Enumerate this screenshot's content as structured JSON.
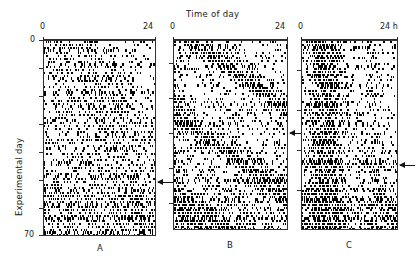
{
  "figure": {
    "title": "Time of day",
    "ylabel": "Experimental day",
    "y_ticks": [
      "0",
      "70"
    ],
    "ink_color": "#000000",
    "axis_color": "#2b2b2b"
  },
  "panels": [
    {
      "letter": "A",
      "x_left_label": "0",
      "x_right_label": "24",
      "arrow_day": 49,
      "pattern": "arrhythmic-scattered"
    },
    {
      "letter": "B",
      "x_left_label": "0",
      "x_right_label": "24",
      "arrow_day": 33,
      "pattern": "free-running-diagonal"
    },
    {
      "letter": "C",
      "x_left_label": "0",
      "x_right_label": "24 h",
      "arrow_day": 44,
      "pattern": "dense-left-entrained"
    }
  ],
  "chart_data": {
    "type": "heatmap",
    "title": "Time of day",
    "xlabel": "Time of day",
    "ylabel": "Experimental day",
    "xlim": [
      0,
      24
    ],
    "ylim": [
      0,
      70
    ],
    "xtick_labels": [
      "0",
      "24"
    ],
    "ytick_labels": [
      "0",
      "70"
    ],
    "grid": false,
    "legend": "none",
    "series": [
      {
        "name": "A",
        "arrow_marker_day": 49,
        "notes": "Activity scattered across all circadian phases (arrhythmic)."
      },
      {
        "name": "B",
        "arrow_marker_day": 33,
        "notes": "Clear free-running band drifting later each day (period > 24 h)."
      },
      {
        "name": "C",
        "arrow_marker_day": 44,
        "notes": "Activity consolidated in the early portion of the day with a dense left band."
      }
    ]
  }
}
